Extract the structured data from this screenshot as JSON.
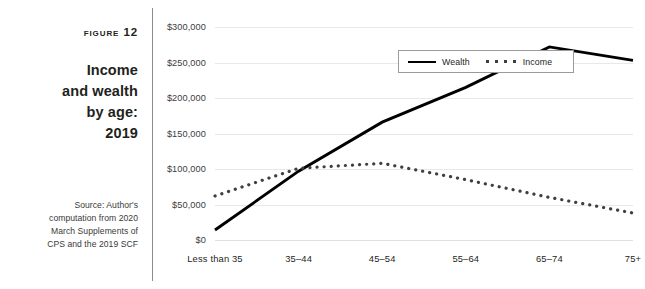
{
  "caption": {
    "figure_label": "Figure 12",
    "title": "Income and wealth by age: 2019",
    "title_lines": [
      "Income",
      "and wealth",
      "by age:",
      "2019"
    ],
    "source": "Source: Author's computation from 2020 March Supplements of CPS and the 2019 SCF",
    "source_lines": [
      "Source: Author's",
      "computation from 2020",
      "March Supplements of",
      "CPS and the 2019 SCF"
    ]
  },
  "legend": {
    "position": "inside-top-left",
    "items": [
      {
        "label": "Wealth",
        "style": "solid",
        "color": "#000000"
      },
      {
        "label": "Income",
        "style": "dotted",
        "color": "#3f3f3f"
      }
    ]
  },
  "chart_data": {
    "type": "line",
    "title": "Income and wealth by age: 2019",
    "xlabel": "",
    "ylabel": "",
    "grid": true,
    "legend_position": "inside-top-left",
    "categories": [
      "Less than 35",
      "35–44",
      "45–54",
      "55–64",
      "65–74",
      "75+"
    ],
    "ylim": [
      0,
      300000
    ],
    "yticks": [
      0,
      50000,
      100000,
      150000,
      200000,
      250000,
      300000
    ],
    "ytick_labels": [
      "$0",
      "$50,000",
      "$100,000",
      "$150,000",
      "$200,000",
      "$250,000",
      "$300,000"
    ],
    "series": [
      {
        "name": "Wealth",
        "style": "solid",
        "color": "#000000",
        "values": [
          14000,
          97000,
          166000,
          215000,
          272000,
          253000
        ]
      },
      {
        "name": "Income",
        "style": "dotted",
        "color": "#3f3f3f",
        "values": [
          62000,
          101000,
          108000,
          85000,
          60000,
          38000
        ]
      }
    ]
  }
}
